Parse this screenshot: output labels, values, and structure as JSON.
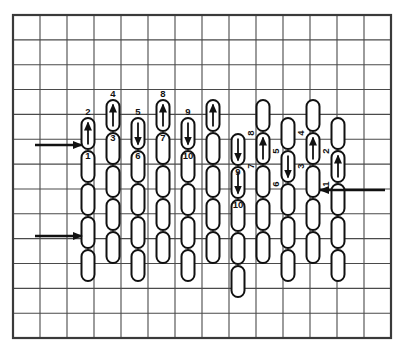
{
  "figure": {
    "type": "diagram",
    "background_color": "#ffffff",
    "ink_color": "#1a1a1a"
  },
  "grid": {
    "x": 13,
    "y": 15,
    "width": 378,
    "height": 323,
    "cols": 14,
    "rows": 13,
    "cell_w": 27.0,
    "cell_h": 24.85,
    "line_color": "#4a4a4a",
    "line_width": 1.1,
    "border_color": "#3a3a3a",
    "border_width": 2.2
  },
  "capsule_style": {
    "width": 13,
    "height": 31,
    "radius": 6.5,
    "stroke": "#111111",
    "stroke_width": 2.0,
    "fill": "#ffffff",
    "gap": 2
  },
  "flow_arrows": [
    {
      "name": "left-arrow-upper",
      "direction": "right",
      "x1": 35,
      "y1": 145,
      "x2": 82,
      "y2": 145
    },
    {
      "name": "left-arrow-lower",
      "direction": "right",
      "x1": 35,
      "y1": 236,
      "x2": 82,
      "y2": 236
    },
    {
      "name": "right-arrow",
      "direction": "left",
      "x1": 385,
      "y1": 190,
      "x2": 320,
      "y2": 190
    }
  ],
  "columns": [
    {
      "name": "column-1",
      "x": 88,
      "top": 118,
      "count": 5,
      "marks": [
        {
          "label": "2",
          "label_pos": "above",
          "label_rot": 0,
          "arrow": "up",
          "index": 0
        },
        {
          "label": "1",
          "label_pos": "below",
          "label_rot": 0,
          "arrow": "none",
          "index": 0
        }
      ]
    },
    {
      "name": "column-2",
      "x": 113,
      "top": 100,
      "count": 5,
      "marks": [
        {
          "label": "4",
          "label_pos": "above",
          "label_rot": 0,
          "arrow": "up",
          "index": 0
        },
        {
          "label": "3",
          "label_pos": "below",
          "label_rot": 0,
          "arrow": "none",
          "index": 0
        }
      ]
    },
    {
      "name": "column-3",
      "x": 138,
      "top": 118,
      "count": 5,
      "marks": [
        {
          "label": "5",
          "label_pos": "above",
          "label_rot": 0,
          "arrow": "down",
          "index": 0
        },
        {
          "label": "6",
          "label_pos": "below",
          "label_rot": 0,
          "arrow": "none",
          "index": 0
        }
      ]
    },
    {
      "name": "column-4",
      "x": 163,
      "top": 100,
      "count": 5,
      "marks": [
        {
          "label": "8",
          "label_pos": "above",
          "label_rot": 0,
          "arrow": "up",
          "index": 0
        },
        {
          "label": "7",
          "label_pos": "below",
          "label_rot": 0,
          "arrow": "none",
          "index": 0
        }
      ]
    },
    {
      "name": "column-5",
      "x": 188,
      "top": 118,
      "count": 5,
      "marks": [
        {
          "label": "9",
          "label_pos": "above",
          "label_rot": 0,
          "arrow": "down",
          "index": 0
        },
        {
          "label": "10",
          "label_pos": "below",
          "label_rot": 0,
          "arrow": "none",
          "index": 0
        }
      ]
    },
    {
      "name": "column-6",
      "x": 213,
      "top": 100,
      "count": 5,
      "marks": [
        {
          "label": "",
          "label_pos": "none",
          "label_rot": 0,
          "arrow": "up",
          "index": 0
        }
      ]
    },
    {
      "name": "column-7",
      "x": 238,
      "top": 134,
      "count": 5,
      "marks": [
        {
          "label": "9",
          "label_pos": "below",
          "label_rot": 0,
          "arrow": "down",
          "index": 0
        },
        {
          "label": "10",
          "label_pos": "below",
          "label_rot": 0,
          "arrow": "down",
          "index": 1
        }
      ]
    },
    {
      "name": "column-8",
      "x": 263,
      "top": 100,
      "count": 5,
      "marks": [
        {
          "label": "8",
          "label_pos": "below",
          "label_rot": -90,
          "arrow": "none",
          "index": 0
        },
        {
          "label": "7",
          "label_pos": "below",
          "label_rot": -90,
          "arrow": "up",
          "index": 1
        }
      ]
    },
    {
      "name": "column-9",
      "x": 288,
      "top": 118,
      "count": 5,
      "marks": [
        {
          "label": "5",
          "label_pos": "below",
          "label_rot": -90,
          "arrow": "none",
          "index": 0
        },
        {
          "label": "6",
          "label_pos": "below",
          "label_rot": -90,
          "arrow": "down",
          "index": 1
        }
      ]
    },
    {
      "name": "column-10",
      "x": 313,
      "top": 100,
      "count": 5,
      "marks": [
        {
          "label": "4",
          "label_pos": "below",
          "label_rot": -90,
          "arrow": "none",
          "index": 0
        },
        {
          "label": "3",
          "label_pos": "below",
          "label_rot": -90,
          "arrow": "up",
          "index": 1
        }
      ]
    },
    {
      "name": "column-11",
      "x": 338,
      "top": 118,
      "count": 5,
      "marks": [
        {
          "label": "2",
          "label_pos": "below",
          "label_rot": -90,
          "arrow": "none",
          "index": 0
        },
        {
          "label": "1",
          "label_pos": "below",
          "label_rot": -90,
          "arrow": "up",
          "index": 1
        }
      ]
    }
  ],
  "labels_all": [
    "1",
    "2",
    "3",
    "4",
    "5",
    "6",
    "7",
    "8",
    "9",
    "10"
  ]
}
